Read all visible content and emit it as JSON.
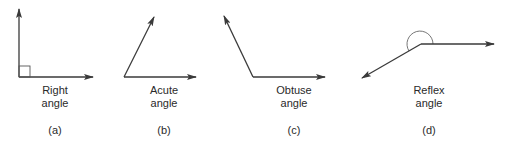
{
  "figure": {
    "panels": [
      {
        "id": "a",
        "line1": "Right",
        "line2": "angle",
        "caption": "(a)"
      },
      {
        "id": "b",
        "line1": "Acute",
        "line2": "angle",
        "caption": "(b)"
      },
      {
        "id": "c",
        "line1": "Obtuse",
        "line2": "angle",
        "caption": "(c)"
      },
      {
        "id": "d",
        "line1": "Reflex",
        "line2": "angle",
        "caption": "(d)"
      }
    ],
    "colors": {
      "line": "#3a3a3a",
      "text": "#2a2a2a",
      "background": "#ffffff"
    }
  }
}
